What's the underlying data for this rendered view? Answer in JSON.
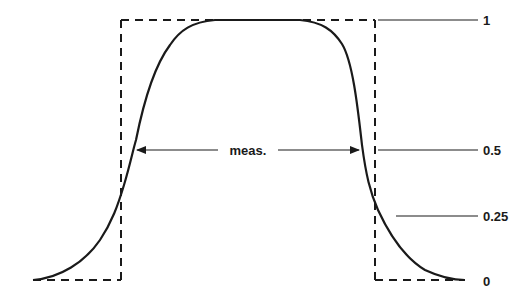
{
  "diagram": {
    "title": "",
    "measurement_label": "meas.",
    "levels": [
      {
        "value": 1,
        "label": "1",
        "y": 20,
        "line_x1": 378,
        "line_x2": 478
      },
      {
        "value": 0.5,
        "label": "0.5",
        "y": 150,
        "line_x1": 378,
        "line_x2": 478
      },
      {
        "value": 0.25,
        "label": "0.25",
        "y": 216,
        "line_x1": 396,
        "line_x2": 478
      },
      {
        "value": 0,
        "label": "0",
        "y": 280,
        "line_x1": null,
        "line_x2": null
      }
    ],
    "ideal_rectangle": {
      "style": "dashed",
      "left_x": 121,
      "right_x": 375,
      "top_y": 20,
      "bottom_y": 280,
      "baseline_left_start_x": 33,
      "baseline_right_end_x": 465
    },
    "measured_pulse": {
      "style": "solid",
      "description": "smooth bell-shaped pulse with flat top; width measured at 0.5 level",
      "half_level_left_x": 134,
      "half_level_right_x": 361
    },
    "colors": {
      "line": "#1a1a1a",
      "background": "#ffffff"
    }
  }
}
